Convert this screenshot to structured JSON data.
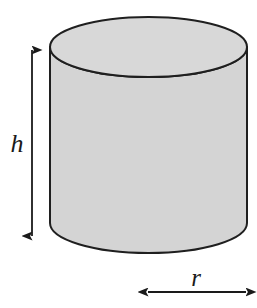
{
  "figure": {
    "name": "cylinder-diagram",
    "shape": "cylinder",
    "background_color": "#ffffff",
    "body_fill_color": "#d4d4d4",
    "top_face_fill_color": "#d8d8d8",
    "outline_color": "#1f1f1f",
    "annotation_color": "#1a1a1a",
    "geometry": {
      "left_x": 50,
      "right_x": 247,
      "top_ellipse_center_y": 47,
      "top_ellipse_ry": 30,
      "bottom_ellipse_center_y": 223,
      "bottom_ellipse_ry": 30,
      "radius_x": 98.5
    }
  },
  "labels": {
    "height": "h",
    "radius": "r"
  },
  "dimensions": {
    "height_arrow": {
      "name": "height-dimension-arrow",
      "orientation": "vertical",
      "x": 32,
      "y_start": 50,
      "y_end": 236,
      "double_headed": true
    },
    "radius_arrow": {
      "name": "radius-dimension-arrow",
      "orientation": "horizontal",
      "y": 292,
      "x_start": 148,
      "x_end": 246,
      "double_headed": true
    }
  }
}
